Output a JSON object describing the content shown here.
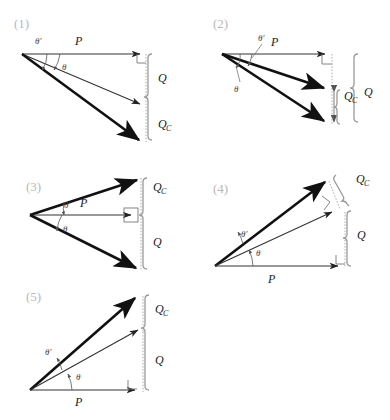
{
  "figure": {
    "background_color": "#ffffff",
    "ink_color": "#111111",
    "bracket_color": "#9a9a9a",
    "panel_label_color": "#b8b8b8",
    "symbols": {
      "P": "P",
      "Q": "Q",
      "Qc_main": "Q",
      "Qc_sub": "C",
      "theta": "θ",
      "theta_prime": "θ′"
    }
  },
  "panels": [
    {
      "id": "panel-1",
      "label": "(1)",
      "vectors": [
        {
          "name": "P",
          "label": "P",
          "style": "thin-horizontal"
        },
        {
          "name": "S",
          "label": "",
          "style": "thin-diagonal-down"
        },
        {
          "name": "Sc",
          "label": "",
          "style": "thick-diagonal-down"
        }
      ],
      "angles": [
        {
          "name": "theta",
          "label": "θ"
        },
        {
          "name": "theta-prime",
          "label": "θ′"
        }
      ],
      "brackets": [
        {
          "name": "Q",
          "label": "Q",
          "sub": ""
        },
        {
          "name": "Qc",
          "label": "Q",
          "sub": "C"
        }
      ],
      "right_angle": true
    },
    {
      "id": "panel-2",
      "label": "(2)",
      "vectors": [
        {
          "name": "P",
          "label": "P",
          "style": "thin-horizontal"
        },
        {
          "name": "S",
          "label": "",
          "style": "thick-diagonal-down"
        },
        {
          "name": "Sc",
          "label": "",
          "style": "thick-diagonal-down-steep"
        }
      ],
      "angles": [
        {
          "name": "theta",
          "label": "θ"
        },
        {
          "name": "theta-prime",
          "label": "θ′"
        }
      ],
      "brackets": [
        {
          "name": "Qc",
          "label": "Q",
          "sub": "C"
        },
        {
          "name": "Q",
          "label": "Q",
          "sub": ""
        }
      ],
      "right_angle": true
    },
    {
      "id": "panel-3",
      "label": "(3)",
      "vectors": [
        {
          "name": "Sc",
          "label": "",
          "style": "thick-diagonal-up"
        },
        {
          "name": "P",
          "label": "P",
          "style": "thin-horizontal"
        },
        {
          "name": "S",
          "label": "",
          "style": "thin-diagonal-down"
        }
      ],
      "angles": [
        {
          "name": "theta",
          "label": "θ"
        },
        {
          "name": "theta-prime",
          "label": "θ′"
        }
      ],
      "brackets": [
        {
          "name": "Qc",
          "label": "Q",
          "sub": "C"
        },
        {
          "name": "Q",
          "label": "Q",
          "sub": ""
        }
      ],
      "right_angle": true
    },
    {
      "id": "panel-4",
      "label": "(4)",
      "vectors": [
        {
          "name": "Sc",
          "label": "",
          "style": "thick-diagonal-up-steep"
        },
        {
          "name": "S",
          "label": "",
          "style": "thin-diagonal-up"
        },
        {
          "name": "P",
          "label": "P",
          "style": "thin-horizontal"
        }
      ],
      "angles": [
        {
          "name": "theta",
          "label": "θ"
        },
        {
          "name": "theta-prime",
          "label": "θ′"
        }
      ],
      "brackets": [
        {
          "name": "Qc",
          "label": "Q",
          "sub": "C"
        },
        {
          "name": "Q",
          "label": "Q",
          "sub": ""
        }
      ],
      "right_angle": true
    },
    {
      "id": "panel-5",
      "label": "(5)",
      "vectors": [
        {
          "name": "Sc",
          "label": "",
          "style": "thick-diagonal-up-steep"
        },
        {
          "name": "S",
          "label": "",
          "style": "thin-diagonal-up"
        },
        {
          "name": "P",
          "label": "P",
          "style": "thin-horizontal"
        }
      ],
      "angles": [
        {
          "name": "theta",
          "label": "θ"
        },
        {
          "name": "theta-prime",
          "label": "θ′"
        }
      ],
      "brackets": [
        {
          "name": "Qc",
          "label": "Q",
          "sub": "C"
        },
        {
          "name": "Q",
          "label": "Q",
          "sub": ""
        }
      ],
      "right_angle": true
    }
  ]
}
